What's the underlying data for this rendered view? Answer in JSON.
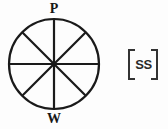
{
  "figure": {
    "background_color": "#fdfdfd",
    "stroke_color": "#1a1a1a"
  },
  "wheel": {
    "name": "eight-spoke-wheel",
    "center_x": 54,
    "center_y": 64,
    "radius": 45,
    "spoke_count": 8,
    "spoke_angles_deg": [
      0,
      45,
      90,
      135,
      180,
      225,
      270,
      315
    ],
    "rim_stroke_width": 2.2,
    "spoke_stroke_width": 2.2
  },
  "labels": {
    "top": "P",
    "bottom": "W"
  },
  "bracket": {
    "name": "bracketed-annotation",
    "text": "SS",
    "left_bracket": "[",
    "right_bracket": "]",
    "stroke_color": "#333333"
  }
}
